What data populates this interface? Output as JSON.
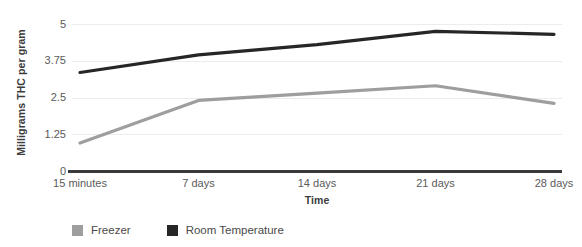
{
  "chart_data": {
    "type": "line",
    "title": "",
    "xlabel": "Time",
    "ylabel": "Milligrams THC per gram",
    "categories": [
      "15 minutes",
      "7 days",
      "14 days",
      "21 days",
      "28 days"
    ],
    "series": [
      {
        "name": "Freezer",
        "color": "#9e9e9e",
        "values": [
          0.95,
          2.4,
          2.65,
          2.9,
          2.3
        ]
      },
      {
        "name": "Room Temperature",
        "color": "#262626",
        "values": [
          3.35,
          3.95,
          4.3,
          4.75,
          4.65
        ]
      }
    ],
    "ylim": [
      0,
      5
    ],
    "yticks": [
      "0",
      "1.25",
      "2.5",
      "3.75",
      "5"
    ],
    "ytick_values": [
      0,
      1.25,
      2.5,
      3.75,
      5
    ],
    "grid": true,
    "gridcolor": "#ececec",
    "legend_position": "bottom-left",
    "axis_color": "#3a3a3a",
    "tick_label_color": "#5a5a5a",
    "axis_title_color": "#3c3c3c"
  },
  "axes": {
    "y_title": "Milligrams THC per gram",
    "x_title": "Time"
  },
  "legend": {
    "items": [
      {
        "label": "Freezer",
        "color": "#9e9e9e"
      },
      {
        "label": "Room Temperature",
        "color": "#262626"
      }
    ]
  }
}
